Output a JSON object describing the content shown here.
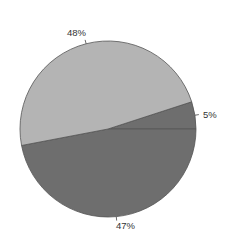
{
  "chart_data": {
    "type": "pie",
    "title": "",
    "categories": [
      "Slice A",
      "Slice B",
      "Slice C"
    ],
    "values": [
      5,
      47,
      48
    ],
    "labels": [
      "5%",
      "47%",
      "48%"
    ],
    "colors": [
      "#6e6e6e",
      "#6e6e6e",
      "#b4b4b4"
    ],
    "start_angle_deg": -18,
    "direction": "clockwise",
    "legend": "none",
    "edge_color": "#555555"
  },
  "labels": {
    "slice_5": "5%",
    "slice_47": "47%",
    "slice_48": "48%"
  }
}
